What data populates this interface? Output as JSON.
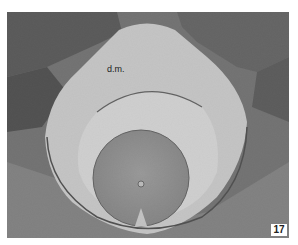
{
  "figure": {
    "annotation_label": "d.m.",
    "figure_number": "17",
    "colors": {
      "background": "#ffffff",
      "tissue_dark": "#3a3a3a",
      "tissue_mid": "#7a7a7a",
      "canal_space": "#f4f4f4",
      "cord": "#9a9a9a",
      "label_box": "#ffffff"
    }
  }
}
